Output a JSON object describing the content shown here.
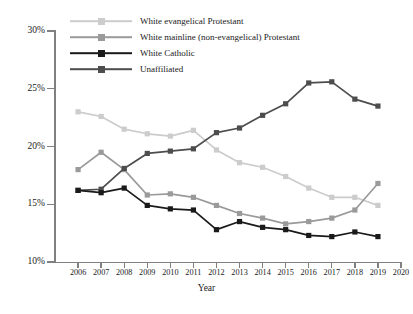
{
  "chart_data": {
    "type": "line",
    "title": "",
    "xlabel": "Year",
    "ylabel": "",
    "x": [
      2006,
      2007,
      2008,
      2009,
      2010,
      2011,
      2012,
      2013,
      2014,
      2015,
      2016,
      2017,
      2018,
      2019
    ],
    "xlim": [
      2005,
      2020
    ],
    "ylim": [
      10,
      30
    ],
    "yticks": [
      "10%",
      "15%",
      "20%",
      "25%",
      "30%"
    ],
    "ytick_values": [
      10,
      15,
      20,
      25,
      30
    ],
    "xticks": [
      "2006",
      "2007",
      "2008",
      "2009",
      "2010",
      "2011",
      "2012",
      "2013",
      "2014",
      "2015",
      "2016",
      "2017",
      "2018",
      "2019",
      "2020"
    ],
    "grid": false,
    "legend_position": "top-left",
    "series": [
      {
        "name": "White evangelical Protestant",
        "color": "#cccccc",
        "values": [
          23.0,
          22.6,
          21.5,
          21.1,
          20.9,
          21.4,
          19.7,
          18.6,
          18.2,
          17.4,
          16.4,
          15.6,
          15.6,
          14.9
        ]
      },
      {
        "name": "White mainline (non-evangelical) Protestant",
        "color": "#9a9a9a",
        "values": [
          18.0,
          19.5,
          18.0,
          15.8,
          15.9,
          15.6,
          14.9,
          14.2,
          13.8,
          13.3,
          13.5,
          13.8,
          14.5,
          16.8
        ]
      },
      {
        "name": "White Catholic",
        "color": "#1a1a1a",
        "values": [
          16.2,
          16.0,
          16.4,
          14.9,
          14.6,
          14.5,
          12.8,
          13.5,
          13.0,
          12.8,
          12.3,
          12.2,
          12.6,
          12.2
        ]
      },
      {
        "name": "Unaffiliated",
        "color": "#4d4d4d",
        "values": [
          16.2,
          16.3,
          18.1,
          19.4,
          19.6,
          19.8,
          21.2,
          21.6,
          22.7,
          23.7,
          25.5,
          25.6,
          24.1,
          23.5
        ]
      }
    ]
  },
  "legend": {
    "items": [
      {
        "label": "White evangelical Protestant",
        "color": "#cccccc"
      },
      {
        "label": "White mainline (non-evangelical) Protestant",
        "color": "#9a9a9a"
      },
      {
        "label": "White Catholic",
        "color": "#1a1a1a"
      },
      {
        "label": "Unaffiliated",
        "color": "#4d4d4d"
      }
    ]
  },
  "axes": {
    "x_title": "Year"
  }
}
